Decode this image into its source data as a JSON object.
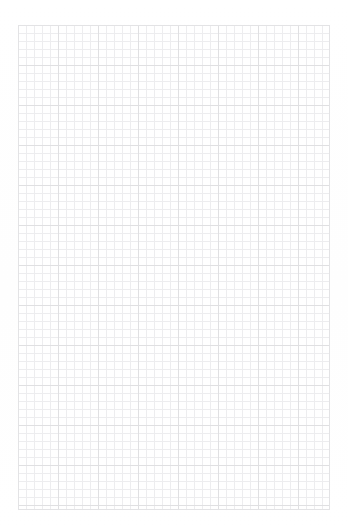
{
  "page": {
    "kind": "grid-paper-sheet",
    "background_color": "#ffffff",
    "width_px": 348,
    "height_px": 531,
    "text_content": ""
  },
  "grid": {
    "left_px": 18,
    "top_px": 25,
    "width_px": 312,
    "height_px": 485,
    "minor_cell_px": 8,
    "major_cell_px": 40,
    "columns": 39,
    "rows": 60,
    "major_interval_cells": 5,
    "minor_line_color": "#ededef",
    "major_line_color": "#e0e0e2",
    "border_color": "#e3e3e5"
  },
  "margins": {
    "top_label": "",
    "bottom_label": "",
    "left_label": "",
    "right_label": ""
  },
  "annotations": []
}
